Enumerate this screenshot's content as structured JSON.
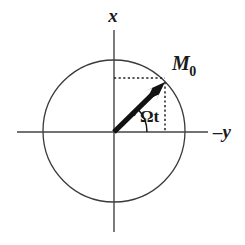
{
  "figure": {
    "background_color": "#ffffff",
    "width": 245,
    "height": 245
  },
  "colors": {
    "axis": "#444444",
    "circle": "#3a3a3a",
    "vector": "#111111",
    "dotted": "#222222",
    "text": "#1a1a1a"
  },
  "axes": {
    "vertical": {
      "label": "x",
      "name": "x-axis",
      "x": 114,
      "y_start": 30,
      "y_end": 232,
      "label_x": 113,
      "label_y": 22,
      "label_size": 19
    },
    "horizontal": {
      "label": "–y",
      "name": "minus-y-axis",
      "y": 132,
      "x_start": 17,
      "x_end": 208,
      "label_x": 213,
      "label_y": 138,
      "label_size": 19
    }
  },
  "circle": {
    "name": "unit-circle",
    "cx": 114,
    "cy": 131,
    "r": 71,
    "stroke_width": 1.3
  },
  "vector": {
    "name": "magnetization-vector",
    "label": "M",
    "subscript": "0",
    "origin_x": 114,
    "origin_y": 132,
    "tip_x": 165,
    "tip_y": 82,
    "angle_deg": 44.4,
    "shaft_width": 5.2,
    "label_x": 172,
    "label_y": 70,
    "label_size": 20,
    "subscript_size": 14
  },
  "angle_arc": {
    "name": "omega-t-arc",
    "label": "Ωt",
    "center_x": 114,
    "center_y": 132,
    "radius": 33,
    "start_deg": 0,
    "end_deg": 44,
    "label_x": 140,
    "label_y": 122,
    "label_size": 17
  },
  "projection_lines": {
    "horizontal": {
      "name": "x-projection-dotted-line",
      "x1": 114,
      "y1": 78,
      "x2": 165,
      "y2": 78
    },
    "vertical": {
      "name": "y-projection-dotted-line",
      "x1": 165,
      "y1": 82,
      "x2": 165,
      "y2": 132
    },
    "dash_pattern": "2.2,2.4",
    "stroke_width": 1.5
  }
}
